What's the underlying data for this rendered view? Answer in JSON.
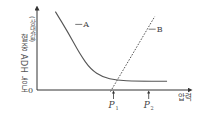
{
  "chart_data": {
    "type": "line",
    "title": "",
    "xlabel": "압력",
    "ylabel": "혈중 ADH 농도",
    "ylabel_unit": "(상댓값)",
    "origin_label": "0",
    "xlim": [
      0,
      10
    ],
    "ylim": [
      0,
      10
    ],
    "grid": false,
    "x_ticks": [
      {
        "label": "P",
        "subscript": "1",
        "x": 5.0
      },
      {
        "label": "P",
        "subscript": "2",
        "x": 7.3
      }
    ],
    "series": [
      {
        "name": "A",
        "style": "solid",
        "x": [
          1.2,
          2.0,
          2.8,
          3.5,
          4.3,
          5.2,
          6.5,
          8.5
        ],
        "y": [
          9.8,
          7.3,
          4.5,
          2.6,
          1.6,
          1.2,
          1.1,
          1.1
        ]
      },
      {
        "name": "B",
        "style": "dashed",
        "x": [
          4.8,
          7.7
        ],
        "y": [
          -0.2,
          9.2
        ]
      }
    ],
    "annotations": [
      {
        "text": "A",
        "series": "A",
        "anchor_x": 2.5,
        "anchor_y": 8.2
      },
      {
        "text": "B",
        "series": "B",
        "anchor_x": 7.3,
        "anchor_y": 7.6
      }
    ],
    "colors": {
      "axis": "#333333",
      "curve": "#555555",
      "text": "#444444"
    }
  }
}
